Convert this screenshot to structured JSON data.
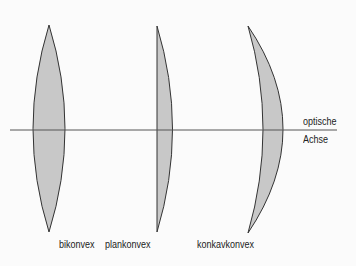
{
  "diagram": {
    "axis_label_line1": "optische",
    "axis_label_line2": "Achse",
    "lenses": [
      {
        "name": "bikonvex",
        "label": "bikonvex"
      },
      {
        "name": "plankonvex",
        "label": "plankonvex"
      },
      {
        "name": "konkavkonvex",
        "label": "konkavkonvex"
      }
    ],
    "colors": {
      "lens_fill": "#c8c8c8",
      "stroke": "#333333",
      "axis": "#555555",
      "background": "#fbfbfb"
    }
  }
}
